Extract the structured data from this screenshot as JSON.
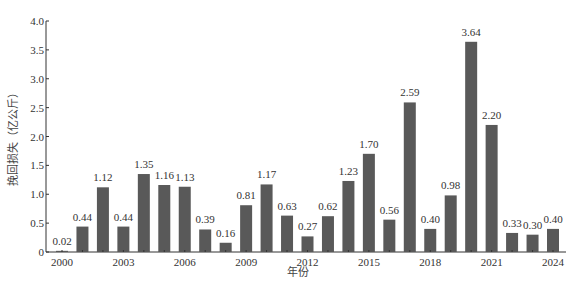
{
  "chart_data": {
    "type": "bar",
    "title": "",
    "xlabel": "年份",
    "ylabel": "挽回损失（亿公斤）",
    "categories": [
      "2000",
      "2001",
      "2002",
      "2003",
      "2004",
      "2005",
      "2006",
      "2007",
      "2008",
      "2009",
      "2010",
      "2011",
      "2012",
      "2013",
      "2014",
      "2015",
      "2016",
      "2017",
      "2018",
      "2019",
      "2020",
      "2021",
      "2022",
      "2023",
      "2024"
    ],
    "values": [
      0.02,
      0.44,
      1.12,
      0.44,
      1.35,
      1.16,
      1.13,
      0.39,
      0.16,
      0.81,
      1.17,
      0.63,
      0.27,
      0.62,
      1.23,
      1.7,
      0.56,
      2.59,
      0.4,
      0.98,
      3.64,
      2.2,
      0.33,
      0.3,
      0.4
    ],
    "value_labels": [
      "0.02",
      "0.44",
      "1.12",
      "0.44",
      "1.35",
      "1.16",
      "1.13",
      "0.39",
      "0.16",
      "0.81",
      "1.17",
      "0.63",
      "0.27",
      "0.62",
      "1.23",
      "1.70",
      "0.56",
      "2.59",
      "0.40",
      "0.98",
      "3.64",
      "2.20",
      "0.33",
      "0.30",
      "0.40"
    ],
    "ylim": [
      0,
      4.0
    ],
    "yticks": [
      0,
      0.5,
      1.0,
      1.5,
      2.0,
      2.5,
      3.0,
      3.5,
      4.0
    ],
    "ytick_labels": [
      "0",
      "0.5",
      "1.0",
      "1.5",
      "2.0",
      "2.5",
      "3.0",
      "3.5",
      "4.0"
    ],
    "xtick_labels": [
      "2000",
      "2003",
      "2006",
      "2009",
      "2012",
      "2015",
      "2018",
      "2021",
      "2024"
    ],
    "grid": false,
    "legend": null,
    "bar_color": "#595959"
  }
}
